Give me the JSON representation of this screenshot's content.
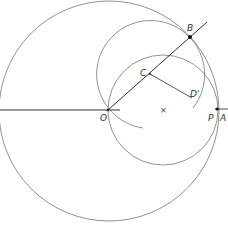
{
  "diagram": {
    "type": "geometric-construction",
    "labels": {
      "B": "B",
      "C": "C",
      "D_prime": "D'",
      "O": "O",
      "P": "P",
      "A": "A",
      "center_mark": "×"
    },
    "points": {
      "O": [
        108,
        110
      ],
      "A": [
        218,
        110
      ],
      "P": [
        217,
        110
      ],
      "B": [
        190,
        37
      ],
      "C": [
        150,
        75
      ],
      "D_prime": [
        192,
        98
      ],
      "X": [
        163,
        110
      ]
    },
    "circles": [
      {
        "name": "large-circle",
        "cx": 109,
        "cy": 111,
        "r": 110
      },
      {
        "name": "circle-center-C",
        "cx": 150,
        "cy": 72,
        "r": 54,
        "partial": true
      },
      {
        "name": "circle-center-X",
        "cx": 163,
        "cy": 110,
        "r": 55
      }
    ],
    "colors": {
      "line": "#555555",
      "point": "#111111",
      "text": "#333333"
    }
  }
}
